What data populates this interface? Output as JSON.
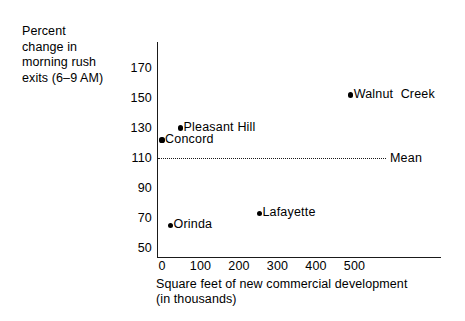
{
  "chart_data": {
    "type": "scatter",
    "title": "",
    "ylabel": "Percent change in morning rush exits (6–9 AM)",
    "xlabel": "Square feet of new commercial development (in thousands)",
    "xlabel_lines": "Square feet of new commercial development\n(in thousands)",
    "ylabel_lines": "Percent\nchange in\nmorning  rush\nexits (6–9 AM)",
    "xlim": [
      -30,
      620
    ],
    "ylim": [
      50,
      180
    ],
    "xticks": [
      0,
      100,
      200,
      300,
      400,
      500
    ],
    "xtick_labels": [
      "0",
      "100",
      "200",
      "300",
      "400",
      "500"
    ],
    "yticks": [
      50,
      70,
      90,
      110,
      130,
      150,
      170
    ],
    "ytick_labels": [
      "50",
      "70",
      "90",
      "110",
      "130",
      "150",
      "170"
    ],
    "grid": false,
    "legend": "none",
    "points": [
      {
        "label": "Walnut  Creek",
        "x": 490,
        "y": 152
      },
      {
        "label": "Pleasant Hill",
        "x": 48,
        "y": 130
      },
      {
        "label": "Concord",
        "x": 0,
        "y": 122
      },
      {
        "label": "Lafayette",
        "x": 253,
        "y": 73
      },
      {
        "label": "Orinda",
        "x": 22,
        "y": 65
      }
    ],
    "reference_lines": [
      {
        "label": "Mean",
        "value": 110,
        "orientation": "horizontal",
        "style": "dotted"
      }
    ],
    "colors": {
      "marker": "#000000",
      "axis": "#1a1a1a",
      "background": "#ffffff",
      "text": "#000000"
    }
  }
}
